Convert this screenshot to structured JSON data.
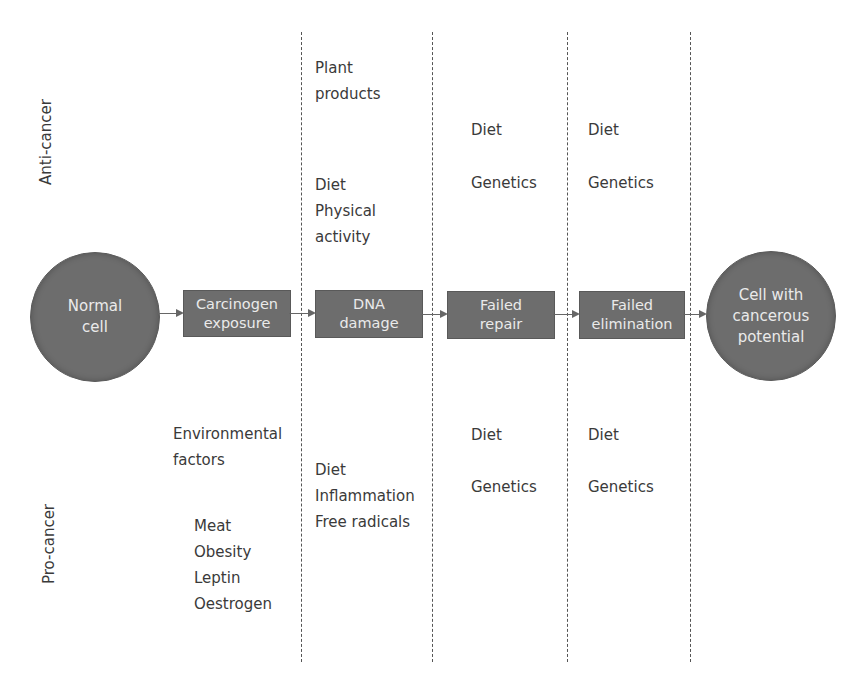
{
  "diagram": {
    "side_labels": {
      "top": "Anti-cancer",
      "bottom": "Pro-cancer"
    },
    "nodes": {
      "start": "Normal\ncell",
      "step1": "Carcinogen\nexposure",
      "step2": "DNA\ndamage",
      "step3": "Failed\nrepair",
      "step4": "Failed\nelimination",
      "end": "Cell with\ncancerous\npotential"
    },
    "anti_cancer": {
      "col_dna_damage_a": "Plant\nproducts",
      "col_dna_damage_b": "Diet\nPhysical\nactivity",
      "col_failed_repair": [
        "Diet",
        "Genetics"
      ],
      "col_failed_elimination": [
        "Diet",
        "Genetics"
      ]
    },
    "pro_cancer": {
      "col_carcinogen_a": "Environmental\nfactors",
      "col_carcinogen_b": "Meat\nObesity\nLeptin\nOestrogen",
      "col_dna_damage": "Diet\nInflammation\nFree radicals",
      "col_failed_repair": [
        "Diet",
        "Genetics"
      ],
      "col_failed_elimination": [
        "Diet",
        "Genetics"
      ]
    },
    "colors": {
      "node_fill": "#6d6d6d",
      "node_text": "#eaeaea",
      "text": "#3a3a3a",
      "divider": "#555555"
    }
  }
}
